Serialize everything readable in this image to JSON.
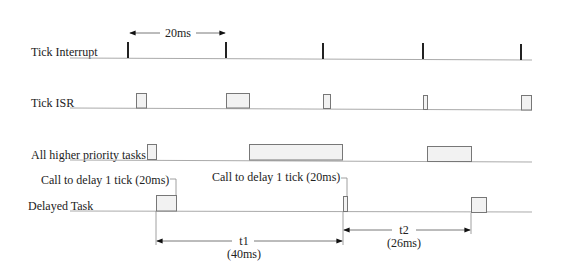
{
  "diagram": {
    "rows": [
      {
        "id": "tick-interrupt",
        "label": "Tick Interrupt",
        "y": 58
      },
      {
        "id": "tick-isr",
        "label": "Tick ISR",
        "y": 108
      },
      {
        "id": "higher-priority",
        "label": "All higher priority tasks",
        "y": 160
      },
      {
        "id": "delayed-task",
        "label": "Delayed Task",
        "y": 211
      }
    ],
    "tick_period_label": "20ms",
    "tick_positions_x": [
      128,
      226,
      323,
      423,
      521
    ],
    "tick_isr_boxes": [
      [
        136,
        147
      ],
      [
        226,
        250
      ],
      [
        323,
        330
      ],
      [
        423,
        427
      ],
      [
        521,
        531
      ]
    ],
    "higher_priority_boxes": [
      [
        147,
        156
      ],
      [
        249,
        343
      ],
      [
        427,
        471
      ]
    ],
    "delayed_task_boxes": [
      [
        156,
        177
      ],
      [
        343,
        348
      ],
      [
        471,
        486
      ]
    ],
    "callouts": [
      {
        "text": "Call to delay 1 tick (20ms)",
        "x": 176
      },
      {
        "text": "Call to delay 1 tick (20ms)",
        "x": 347
      }
    ],
    "intervals": [
      {
        "name": "t1",
        "value": "(40ms)",
        "from": 156,
        "to": 343,
        "y": 241
      },
      {
        "name": "t2",
        "value": "(26ms)",
        "from": 343,
        "to": 471,
        "y": 230
      }
    ]
  }
}
